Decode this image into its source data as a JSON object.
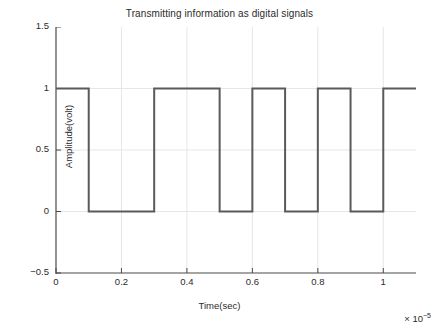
{
  "chart_data": {
    "type": "line",
    "title": "Transmitting information as digital signals",
    "xlabel": "Time(sec)",
    "ylabel": "Amplitude(volt)",
    "x_exponent_prefix": "× 10",
    "x_exponent_power": "−5",
    "x_scale_factor": 1e-05,
    "xlim": [
      0,
      1.1
    ],
    "ylim": [
      -0.5,
      1.5
    ],
    "xticks": [
      "0",
      "0.2",
      "0.4",
      "0.6",
      "0.8",
      "1"
    ],
    "xtick_values": [
      0,
      0.2,
      0.4,
      0.6,
      0.8,
      1
    ],
    "yticks": [
      "1.5",
      "1",
      "0.5",
      "0",
      "−0.5"
    ],
    "ytick_values": [
      1.5,
      1,
      0.5,
      0,
      -0.5
    ],
    "grid": true,
    "legend": null,
    "line_color": "#5a5a5a",
    "line_width": 2,
    "bit_duration": 0.1,
    "bits": [
      1,
      0,
      0,
      1,
      1,
      0,
      1,
      0,
      1,
      0,
      1
    ],
    "x": [
      0,
      0.1,
      0.1,
      0.3,
      0.3,
      0.5,
      0.5,
      0.6,
      0.6,
      0.7,
      0.7,
      0.8,
      0.8,
      0.9,
      0.9,
      1.0,
      1.0,
      1.1
    ],
    "values": [
      1,
      1,
      0,
      0,
      1,
      1,
      0,
      0,
      1,
      1,
      0,
      0,
      1,
      1,
      0,
      0,
      1,
      1
    ],
    "segments": [
      {
        "start": 0.0,
        "end": 0.1,
        "level": 1
      },
      {
        "start": 0.1,
        "end": 0.3,
        "level": 0
      },
      {
        "start": 0.3,
        "end": 0.5,
        "level": 1
      },
      {
        "start": 0.5,
        "end": 0.6,
        "level": 0
      },
      {
        "start": 0.6,
        "end": 0.7,
        "level": 1
      },
      {
        "start": 0.7,
        "end": 0.8,
        "level": 0
      },
      {
        "start": 0.8,
        "end": 0.9,
        "level": 1
      },
      {
        "start": 0.9,
        "end": 1.0,
        "level": 0
      },
      {
        "start": 1.0,
        "end": 1.1,
        "level": 1
      }
    ]
  },
  "figure": {
    "background_color": "#ffffff",
    "axis_color": "#4a4a4a",
    "grid_color": "#e6e6e6",
    "text_color": "#2b2b2b"
  }
}
